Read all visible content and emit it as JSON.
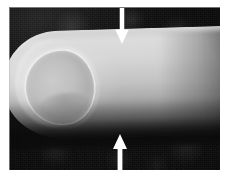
{
  "figure": {
    "kind": "grayscale-clinical-photograph",
    "background_color": "#0c0c0c",
    "page_color": "#ffffff",
    "annotation_color": "#ffffff",
    "photo": {
      "left": 9,
      "top": 7,
      "width": 211,
      "height": 163
    },
    "regions": [
      {
        "name": "fingernail",
        "tone": "light-gray"
      },
      {
        "name": "nail-rim-highlight",
        "tone": "bright-white"
      },
      {
        "name": "skin-creases",
        "tone": "mid-gray"
      },
      {
        "name": "proximal-shading",
        "tone": "dark-gray"
      },
      {
        "name": "dark-background",
        "tone": "near-black"
      }
    ],
    "annotations": [
      {
        "name": "arrow-top",
        "direction": "down",
        "color": "#ffffff",
        "x": 122,
        "y_from": 8,
        "y_to": 44,
        "marks": "dorsal surface of the finger"
      },
      {
        "name": "arrow-bottom",
        "direction": "up",
        "color": "#ffffff",
        "x": 120,
        "y_from": 170,
        "y_to": 134,
        "marks": "volar surface of the finger"
      }
    ]
  }
}
